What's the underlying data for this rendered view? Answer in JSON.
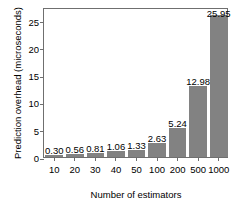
{
  "chart_data": {
    "type": "bar",
    "title": "",
    "xlabel": "Number of estimators",
    "ylabel": "Prediction overhead (microseconds)",
    "categories": [
      "10",
      "20",
      "30",
      "40",
      "50",
      "100",
      "200",
      "500",
      "1000"
    ],
    "values": [
      0.3,
      0.56,
      0.81,
      1.06,
      1.33,
      2.63,
      5.24,
      12.98,
      25.95
    ],
    "value_labels": [
      "0.30",
      "0.56",
      "0.81",
      "1.06",
      "1.33",
      "2.63",
      "5.24",
      "12.98",
      "25.95"
    ],
    "ylim": [
      0,
      27.5
    ],
    "yticks": [
      0,
      5,
      10,
      15,
      20,
      25
    ],
    "ytick_labels": [
      "0",
      "5",
      "10",
      "15",
      "20",
      "25"
    ],
    "grid": false,
    "legend": null,
    "bar_color": "#828282",
    "frame_color": "#6f6f6f",
    "background": "#ffffff"
  }
}
